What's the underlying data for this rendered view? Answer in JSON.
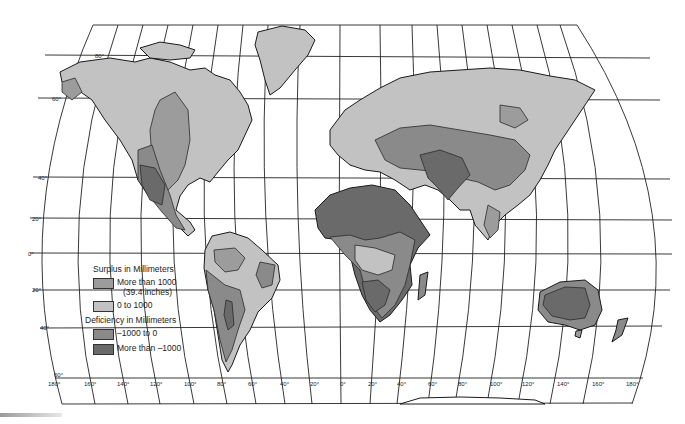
{
  "map": {
    "projection": "Robinson-style world map",
    "colors": {
      "ocean": "#ffffff",
      "surplus_high": "#9c9c9c",
      "surplus_low": "#c2c2c2",
      "deficit_low": "#8a8a8a",
      "deficit_high": "#6a6a6a",
      "grid": "#222222"
    },
    "latitude_labels": [
      "80°",
      "60°",
      "40°",
      "20°",
      "0°",
      "20°",
      "40°",
      "60°"
    ],
    "longitude_labels": [
      "180°",
      "160°",
      "140°",
      "120°",
      "100°",
      "80°",
      "60°",
      "40°",
      "20°",
      "0°",
      "20°",
      "40°",
      "60°",
      "80°",
      "100°",
      "120°",
      "140°",
      "160°",
      "180°"
    ]
  },
  "legend": {
    "surplus_heading": "Surplus in Millimeters",
    "surplus_items": [
      {
        "label": "More than 1000",
        "sublabel": "(39.4 inches)",
        "color": "#9c9c9c"
      },
      {
        "label": "0 to 1000",
        "color": "#c2c2c2"
      }
    ],
    "deficiency_heading": "Deficiency in Millimeters",
    "deficiency_items": [
      {
        "label": "–1000 to 0",
        "color": "#8a8a8a"
      },
      {
        "label": "More than –1000",
        "color": "#6a6a6a"
      }
    ]
  }
}
